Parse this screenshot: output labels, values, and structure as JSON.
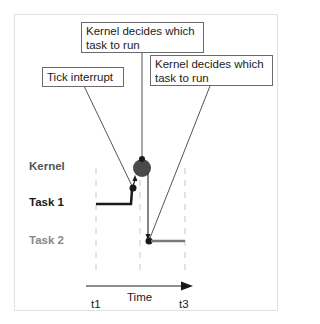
{
  "callouts": {
    "tick_interrupt": "Tick interrupt",
    "kernel_decides_1_line1": "Kernel decides which",
    "kernel_decides_1_line2": "task to run",
    "kernel_decides_2_line1": "Kernel decides which",
    "kernel_decides_2_line2": "task to run"
  },
  "lanes": {
    "kernel": "Kernel",
    "task1": "Task 1",
    "task2": "Task 2"
  },
  "axis": {
    "label": "Time",
    "ticks": [
      "t1",
      "t3"
    ]
  },
  "colors": {
    "kernel_label": "#555555",
    "task1": "#1a1a1a",
    "task2": "#7a7a7a",
    "kernel_node": "#4a4a4a",
    "leader_line": "#555555",
    "dashed": "#c8c8c8"
  }
}
